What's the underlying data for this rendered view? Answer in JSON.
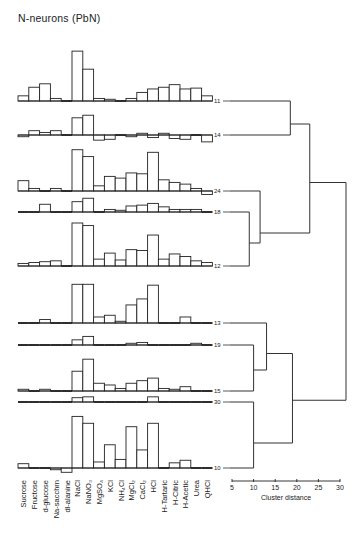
{
  "title": "N-neurons (PbN)",
  "chart_data": {
    "type": "bar",
    "subtype": "small-multiple histograms with dendrogram",
    "title": "N-neurons (PbN)",
    "categories": [
      "Sucrose",
      "Fructose",
      "d-glucose",
      "Na-saccharin",
      "dl-alanine",
      "NaCl",
      "NaNO3",
      "MgSO4",
      "KCl",
      "NH4Cl",
      "MgCl2",
      "CaCl2",
      "HCl",
      "H-Tartaric",
      "H-Citric",
      "H-Acetic",
      "Urea",
      "QHCl"
    ],
    "series": [
      {
        "name": "11",
        "values": [
          6,
          16,
          20,
          3,
          1,
          58,
          37,
          3,
          2,
          -1,
          3,
          10,
          14,
          16,
          19,
          14,
          15,
          6
        ]
      },
      {
        "name": "14",
        "values": [
          -2,
          5,
          3,
          5,
          1,
          20,
          23,
          -6,
          -5,
          -1,
          -2,
          2,
          -3,
          2,
          -4,
          -5,
          1,
          -8
        ]
      },
      {
        "name": "24",
        "values": [
          12,
          3,
          1,
          3,
          -1,
          48,
          40,
          6,
          17,
          15,
          21,
          20,
          45,
          13,
          10,
          8,
          3,
          -4
        ]
      },
      {
        "name": "18",
        "values": [
          0,
          1,
          9,
          1,
          -1,
          12,
          16,
          1,
          3,
          2,
          7,
          8,
          10,
          6,
          3,
          3,
          3,
          0
        ]
      },
      {
        "name": "12",
        "values": [
          3,
          4,
          5,
          6,
          0,
          50,
          47,
          8,
          15,
          7,
          19,
          18,
          36,
          8,
          14,
          11,
          6,
          4
        ]
      },
      {
        "name": "13",
        "values": [
          1,
          0,
          4,
          1,
          -1,
          45,
          45,
          7,
          9,
          2,
          21,
          28,
          44,
          1,
          1,
          7,
          1,
          1
        ]
      },
      {
        "name": "19",
        "values": [
          0,
          1,
          1,
          1,
          0,
          6,
          10,
          0,
          1,
          1,
          2,
          3,
          1,
          1,
          1,
          1,
          2,
          1
        ]
      },
      {
        "name": "15",
        "values": [
          2,
          0,
          2,
          1,
          0,
          23,
          37,
          9,
          7,
          3,
          9,
          12,
          15,
          3,
          2,
          5,
          1,
          1
        ]
      },
      {
        "name": "30",
        "values": [
          0,
          0,
          1,
          0,
          0,
          5,
          6,
          0,
          0,
          0,
          1,
          1,
          6,
          0,
          0,
          1,
          0,
          0
        ]
      },
      {
        "name": "10",
        "values": [
          5,
          -1,
          1,
          -2,
          -5,
          60,
          52,
          7,
          27,
          10,
          48,
          21,
          52,
          -1,
          6,
          9,
          1,
          -1
        ]
      }
    ],
    "dendrogram": {
      "leaf_order": [
        "11",
        "14",
        "24",
        "18",
        "12",
        "13",
        "19",
        "15",
        "30",
        "10"
      ],
      "merges": [
        {
          "clusters": [
            "11",
            "14"
          ],
          "distance": 18.5
        },
        {
          "clusters": [
            "18",
            "12"
          ],
          "distance": 9.0
        },
        {
          "clusters": [
            "24",
            "18+12"
          ],
          "distance": 11.5
        },
        {
          "clusters": [
            "11+14",
            "24+18+12"
          ],
          "distance": 23.0
        },
        {
          "clusters": [
            "19",
            "15"
          ],
          "distance": 10.0
        },
        {
          "clusters": [
            "13",
            "19+15"
          ],
          "distance": 13.0
        },
        {
          "clusters": [
            "30",
            "10"
          ],
          "distance": 10.0
        },
        {
          "clusters": [
            "13+19+15",
            "30+10"
          ],
          "distance": 19.0
        },
        {
          "clusters": [
            "all-upper",
            "all-lower"
          ],
          "distance": 33.0
        }
      ]
    },
    "xlabel": "Cluster distance",
    "x_ticks": [
      5,
      10,
      15,
      20,
      25,
      30
    ],
    "xlim": [
      5,
      30
    ],
    "grid": false,
    "legend": "none"
  }
}
